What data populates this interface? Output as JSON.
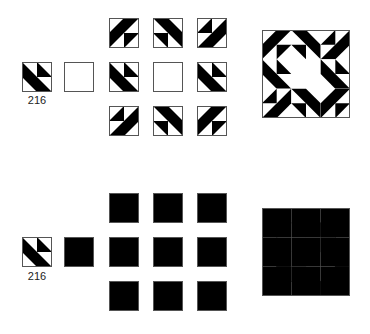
{
  "colors": {
    "ink": "#000000",
    "paper": "#ffffff",
    "frame": "#555555"
  },
  "base_tile_shape": {
    "band": [
      [
        0,
        0
      ],
      [
        2,
        2
      ],
      [
        1,
        2
      ],
      [
        0,
        1
      ]
    ],
    "triangle": [
      [
        1,
        0
      ],
      [
        2,
        1
      ],
      [
        1,
        1
      ]
    ]
  },
  "panels": [
    {
      "id": "top",
      "base_tile": {
        "label": "216",
        "rotation": 0
      },
      "center_fill": "white",
      "grid": [
        [
          90,
          180,
          270
        ],
        [
          0,
          "center",
          0
        ],
        [
          270,
          180,
          90
        ]
      ]
    },
    {
      "id": "bottom",
      "base_tile": {
        "label": "216",
        "rotation": 0
      },
      "center_fill": "black",
      "grid": [
        [
          90,
          180,
          270
        ],
        [
          0,
          "center",
          0
        ],
        [
          270,
          180,
          90
        ]
      ]
    }
  ]
}
